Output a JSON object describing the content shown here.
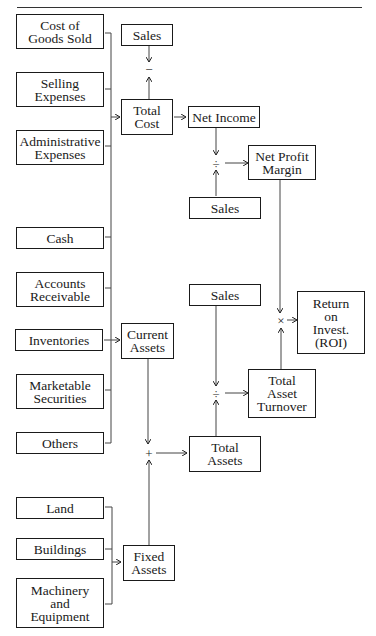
{
  "diagram": {
    "title": "",
    "nodes": {
      "cost_of_goods_sold": "Cost of\nGoods Sold",
      "selling_expenses": "Selling\nExpenses",
      "administrative_expenses": "Administrative\nExpenses",
      "cash": "Cash",
      "accounts_receivable": "Accounts\nReceivable",
      "inventories": "Inventories",
      "marketable_securities": "Marketable\nSecurities",
      "others": "Others",
      "land": "Land",
      "buildings": "Buildings",
      "machinery_and_equipment": "Machinery\nand\nEquipment",
      "sales_top": "Sales",
      "total_cost": "Total\nCost",
      "net_income": "Net Income",
      "sales_mid": "Sales",
      "net_profit_margin": "Net Profit\nMargin",
      "current_assets": "Current\nAssets",
      "fixed_assets": "Fixed\nAssets",
      "sales_lower": "Sales",
      "total_assets": "Total\nAssets",
      "total_asset_turnover": "Total\nAsset\nTurnover",
      "roi": "Return\non\nInvest.\n(ROI)"
    },
    "operators": {
      "subtract": "−",
      "divide_npm": "÷",
      "divide_tat": "÷",
      "add": "+",
      "multiply": "×"
    },
    "edges": [
      [
        "cost_of_goods_sold",
        "total_cost"
      ],
      [
        "selling_expenses",
        "total_cost"
      ],
      [
        "administrative_expenses",
        "total_cost"
      ],
      [
        "sales_top",
        "subtract"
      ],
      [
        "total_cost",
        "subtract"
      ],
      [
        "total_cost",
        "net_income"
      ],
      [
        "net_income",
        "divide_npm"
      ],
      [
        "sales_mid",
        "divide_npm"
      ],
      [
        "divide_npm",
        "net_profit_margin"
      ],
      [
        "cash",
        "current_assets"
      ],
      [
        "accounts_receivable",
        "current_assets"
      ],
      [
        "inventories",
        "current_assets"
      ],
      [
        "marketable_securities",
        "current_assets"
      ],
      [
        "others",
        "current_assets"
      ],
      [
        "land",
        "fixed_assets"
      ],
      [
        "buildings",
        "fixed_assets"
      ],
      [
        "machinery_and_equipment",
        "fixed_assets"
      ],
      [
        "current_assets",
        "add"
      ],
      [
        "fixed_assets",
        "add"
      ],
      [
        "add",
        "total_assets"
      ],
      [
        "sales_lower",
        "divide_tat"
      ],
      [
        "total_assets",
        "divide_tat"
      ],
      [
        "divide_tat",
        "total_asset_turnover"
      ],
      [
        "net_profit_margin",
        "multiply"
      ],
      [
        "total_asset_turnover",
        "multiply"
      ],
      [
        "multiply",
        "roi"
      ]
    ]
  }
}
